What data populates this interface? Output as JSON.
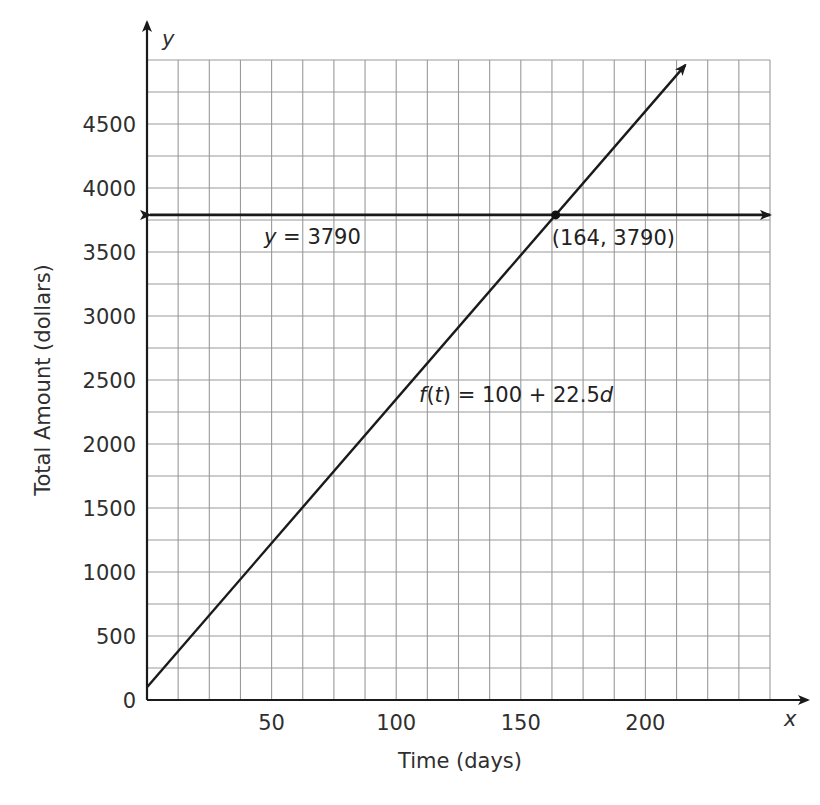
{
  "chart_data": {
    "type": "line",
    "title": "",
    "xlabel": "Time (days)",
    "ylabel": "Total Amount (dollars)",
    "x_axis_symbol": "x",
    "y_axis_symbol": "y",
    "xlim": [
      0,
      250
    ],
    "ylim": [
      0,
      5000
    ],
    "x_ticks": [
      50,
      100,
      150,
      200
    ],
    "y_ticks": [
      0,
      500,
      1000,
      1500,
      2000,
      2500,
      3000,
      3500,
      4000,
      4500
    ],
    "x_grid_step": 12.5,
    "y_grid_step": 250,
    "grid": true,
    "series": [
      {
        "name": "f(t) = 100 + 22.5d",
        "label_parts": {
          "f": "f",
          "paren_open": "(",
          "t": "t",
          "rest": ") = 100 + 22.5",
          "d": "d"
        },
        "kind": "linear",
        "intercept": 100,
        "slope": 22.5,
        "x": [
          0,
          50,
          100,
          150,
          164,
          216
        ],
        "values": [
          100,
          1225,
          2350,
          3475,
          3790,
          4960
        ]
      },
      {
        "name": "y = 3790",
        "label_parts": {
          "y": "y",
          "rest": " = 3790"
        },
        "kind": "horizontal",
        "value": 3790
      }
    ],
    "annotations": [
      {
        "type": "point",
        "x": 164,
        "y": 3790,
        "label": "(164, 3790)"
      }
    ]
  }
}
